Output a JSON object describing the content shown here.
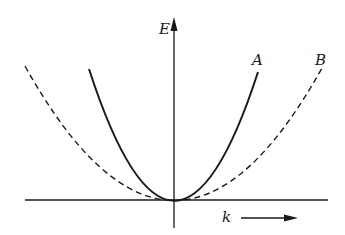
{
  "diagram": {
    "type": "energy-dispersion",
    "axes": {
      "y_label": "E",
      "x_label": "k",
      "x_arrow": "right-arrow"
    },
    "curves": [
      {
        "label": "A",
        "style": "solid",
        "shape": "parabola",
        "curvature": "narrow"
      },
      {
        "label": "B",
        "style": "dashed",
        "shape": "parabola",
        "curvature": "wide"
      }
    ],
    "colors": {
      "ink": "#1a1a1a",
      "background": "#ffffff"
    }
  }
}
